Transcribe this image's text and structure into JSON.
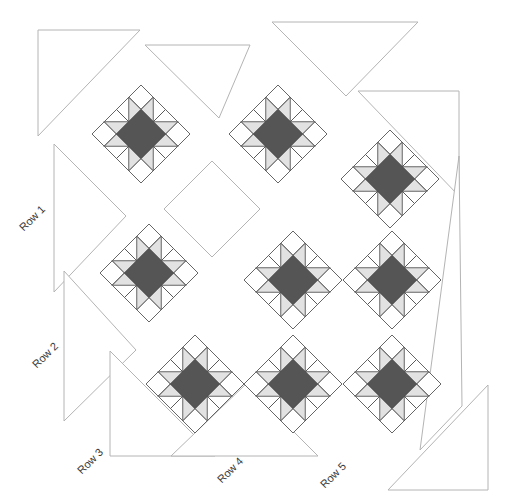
{
  "diagram": {
    "colors": {
      "background": "#ffffff",
      "outline_light": "#b4b4b4",
      "outline_dark": "#4a4a4a",
      "center": "#555555",
      "triangle_light": "#e2e2e2",
      "patch_white": "#ffffff",
      "label": "#3a3a3a"
    },
    "block": {
      "name": "Star block",
      "grid": 4,
      "unit_half_diagonal": 12.25,
      "description": "4x4 grid set on point: dark center square (2x2), light half-square-triangle star points, white corner and edge squares"
    },
    "blocks": [
      {
        "id": 1,
        "type": "pieced",
        "cx": 141,
        "cy": 134
      },
      {
        "id": 2,
        "type": "pieced",
        "cx": 278,
        "cy": 134
      },
      {
        "id": 3,
        "type": "pieced",
        "cx": 390,
        "cy": 179
      },
      {
        "id": 4,
        "type": "pieced",
        "cx": 149,
        "cy": 273
      },
      {
        "id": 5,
        "type": "pieced",
        "cx": 293,
        "cy": 280
      },
      {
        "id": 6,
        "type": "pieced",
        "cx": 392,
        "cy": 280
      },
      {
        "id": 7,
        "type": "pieced",
        "cx": 195,
        "cy": 384
      },
      {
        "id": 8,
        "type": "pieced",
        "cx": 293,
        "cy": 384
      },
      {
        "id": 9,
        "type": "pieced",
        "cx": 392,
        "cy": 384
      }
    ],
    "setting_squares": [
      {
        "id": "s1",
        "cx": 212,
        "cy": 209,
        "half": 48
      }
    ],
    "setting_triangles": [
      {
        "id": "t1",
        "points": "38,30 140,30 38,136"
      },
      {
        "id": "t2",
        "points": "145,45 250,45 219,118"
      },
      {
        "id": "t3",
        "points": "272,22 418,22 346,96"
      },
      {
        "id": "t4",
        "points": "358,91 459,91 459,196"
      },
      {
        "id": "t5",
        "points": "54,144 126,216 54,292"
      },
      {
        "id": "t6",
        "points": "64,271 136,350 64,421"
      },
      {
        "id": "t7",
        "points": "110,351 215,456 110,456"
      },
      {
        "id": "t8",
        "points": "459,156 462,406 420,450"
      },
      {
        "id": "t9",
        "points": "488,385 488,490 388,490"
      },
      {
        "id": "t10",
        "points": "171,456 318,456 246,384"
      }
    ],
    "row_labels": [
      {
        "text": "Row 1",
        "x": 32,
        "y": 218
      },
      {
        "text": "Row 2",
        "x": 45,
        "y": 355
      },
      {
        "text": "Row 3",
        "x": 90,
        "y": 461
      },
      {
        "text": "Row 4",
        "x": 230,
        "y": 470
      },
      {
        "text": "Row 5",
        "x": 333,
        "y": 475
      }
    ]
  }
}
